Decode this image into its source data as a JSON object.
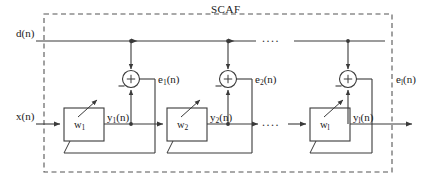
{
  "figure": {
    "title": "SCAF",
    "type": "block-diagram"
  },
  "inputs": {
    "desired_signal": "d(n)",
    "input_signal": "x(n)"
  },
  "stages": [
    {
      "weight_label": "w",
      "weight_sub": "1",
      "output_label": "y",
      "output_sub": "1",
      "output_suffix": "(n)",
      "error_label": "e",
      "error_sub": "1",
      "error_suffix": "(n)"
    },
    {
      "weight_label": "w",
      "weight_sub": "2",
      "output_label": "y",
      "output_sub": "2",
      "output_suffix": "(n)",
      "error_label": "e",
      "error_sub": "2",
      "error_suffix": "(n)"
    },
    {
      "weight_label": "w",
      "weight_sub": "l",
      "output_label": "y",
      "output_sub": "l",
      "output_suffix": "(n)",
      "error_label": "e",
      "error_sub": "l",
      "error_suffix": "(n)"
    }
  ],
  "adder_symbols": {
    "plus": "+",
    "minus": "−"
  },
  "ellipsis": {
    "top": "....",
    "middle": "....",
    "bottom": "...."
  },
  "colors": {
    "line": "#3a3a3a",
    "dashed_border": "#555555",
    "text": "#1a1a1a",
    "background": "#ffffff"
  }
}
